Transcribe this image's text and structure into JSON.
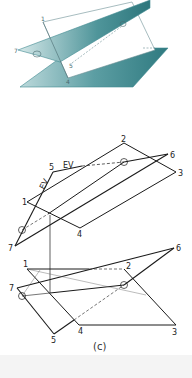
{
  "figure": {
    "caption": "(c)",
    "colors": {
      "plane_fill": "#3f8a90",
      "plane_fill_light": "#cfe3e4",
      "line": "#1a1a1a",
      "construction_line": "#5f8f94"
    },
    "pictorial": {
      "labels": {
        "p1": "1",
        "p4": "4",
        "p5": "5",
        "p7": "7",
        "p6": "6"
      }
    },
    "top_view": {
      "labels": {
        "p1": "1",
        "p2": "2",
        "p3": "3",
        "p4": "4",
        "p5": "5",
        "p6": "6",
        "p7": "7"
      },
      "ev_labels": [
        "EV",
        "EV"
      ]
    },
    "front_view": {
      "labels": {
        "p1": "1",
        "p2": "2",
        "p3": "3",
        "p4": "4",
        "p5": "5",
        "p6": "6",
        "p7": "7"
      }
    }
  }
}
